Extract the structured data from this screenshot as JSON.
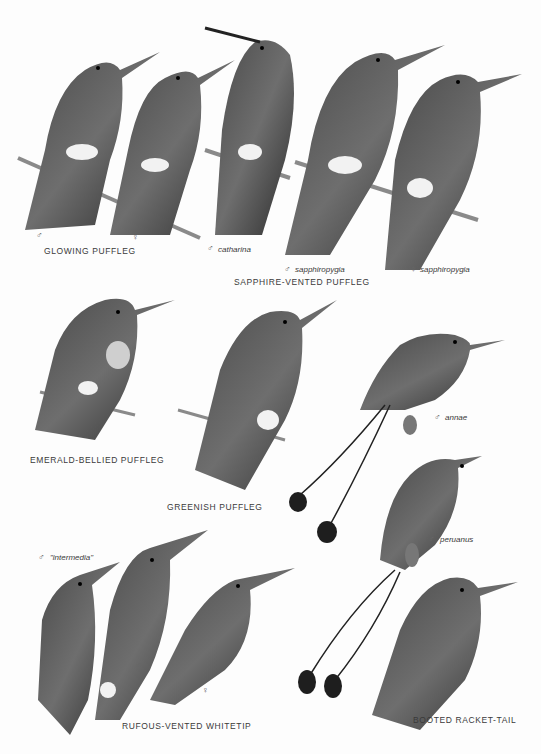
{
  "plate": {
    "species": [
      {
        "name": "GLOWING PUFFLEG",
        "figures": [
          {
            "sex": "♂",
            "subspecies": ""
          },
          {
            "sex": "♀",
            "subspecies": ""
          }
        ]
      },
      {
        "name": "SAPPHIRE-VENTED PUFFLEG",
        "figures": [
          {
            "sex": "♂",
            "subspecies": "catharina"
          },
          {
            "sex": "♂",
            "subspecies": "sapphiropygia"
          },
          {
            "sex": "♀",
            "subspecies": "sapphiropygia"
          }
        ]
      },
      {
        "name": "EMERALD-BELLIED PUFFLEG",
        "figures": []
      },
      {
        "name": "GREENISH PUFFLEG",
        "figures": []
      },
      {
        "name": "BOOTED RACKET-TAIL",
        "figures": [
          {
            "sex": "♂",
            "subspecies": "annae"
          },
          {
            "sex": "♂",
            "subspecies": "peruanus"
          },
          {
            "sex": "♀",
            "subspecies": ""
          }
        ]
      },
      {
        "name": "RUFOUS-VENTED WHITETIP",
        "figures": [
          {
            "sex": "♂",
            "subspecies": "\"intermedia\""
          },
          {
            "sex": "♂",
            "subspecies": ""
          },
          {
            "sex": "♀",
            "subspecies": ""
          }
        ]
      }
    ],
    "colors": {
      "ink": "#2a2a2a",
      "mid": "#555555",
      "light": "#888888",
      "white_patch": "#f2f2f2",
      "branch": "#8a8a8a"
    }
  }
}
